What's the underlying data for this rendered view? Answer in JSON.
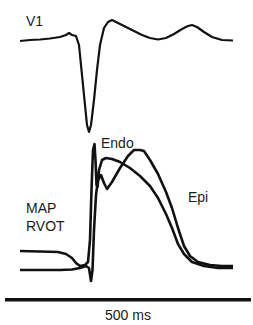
{
  "figure": {
    "traces": [
      {
        "id": "v1",
        "label": "V1",
        "description": "Surface ECG lead V1"
      },
      {
        "id": "endo",
        "label": "Endo",
        "description": "Endocardial monophasic action potential"
      },
      {
        "id": "epi",
        "label": "Epi",
        "description": "Epicardial monophasic action potential"
      }
    ],
    "map_label_line1": "MAP",
    "map_label_line2": "RVOT",
    "scale_bar": {
      "label": "500 ms"
    },
    "colors": {
      "trace": "#111111",
      "background": "#ffffff"
    }
  }
}
